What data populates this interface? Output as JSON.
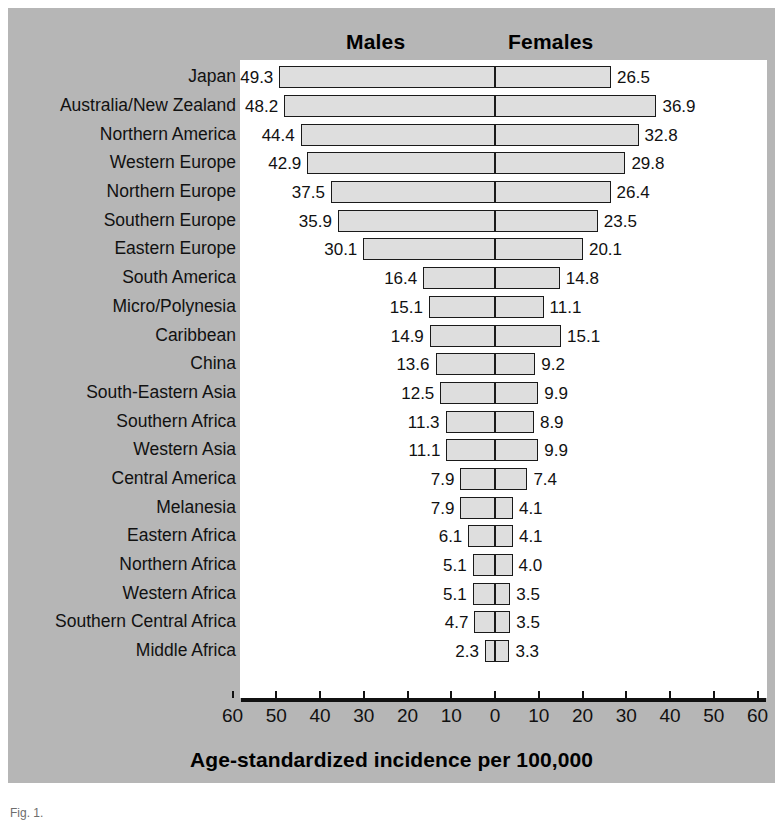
{
  "figure": {
    "caption": "Fig. 1."
  },
  "headers": {
    "males": "Males",
    "females": "Females"
  },
  "axis": {
    "title": "Age-standardized incidence per 100,000",
    "tick_labels": [
      "60",
      "50",
      "40",
      "30",
      "20",
      "10",
      "0",
      "10",
      "20",
      "30",
      "40",
      "50",
      "60"
    ]
  },
  "colors": {
    "panel_background": "#b6b6b6",
    "plot_background": "#ffffff",
    "bar_fill": "#dedede",
    "bar_stroke": "#1a1a1a",
    "text": "#111111"
  },
  "chart_data": {
    "type": "bar",
    "subtype": "diverging-population-pyramid",
    "title": "",
    "xlabel": "Age-standardized incidence per 100,000",
    "ylabel": "",
    "xlim": [
      -60,
      60
    ],
    "xticks": [
      -60,
      -50,
      -40,
      -30,
      -20,
      -10,
      0,
      10,
      20,
      30,
      40,
      50,
      60
    ],
    "xtick_labels": [
      "60",
      "50",
      "40",
      "30",
      "20",
      "10",
      "0",
      "10",
      "20",
      "30",
      "40",
      "50",
      "60"
    ],
    "grid": false,
    "legend": [
      "Males",
      "Females"
    ],
    "legend_position": "top",
    "categories": [
      "Japan",
      "Australia/New Zealand",
      "Northern America",
      "Western Europe",
      "Northern Europe",
      "Southern Europe",
      "Eastern Europe",
      "South America",
      "Micro/Polynesia",
      "Caribbean",
      "China",
      "South-Eastern Asia",
      "Southern Africa",
      "Western Asia",
      "Central America",
      "Melanesia",
      "Eastern Africa",
      "Northern Africa",
      "Western Africa",
      "Southern Central Africa",
      "Middle Africa"
    ],
    "series": [
      {
        "name": "Males",
        "direction": "left",
        "values": [
          49.3,
          48.2,
          44.4,
          42.9,
          37.5,
          35.9,
          30.1,
          16.4,
          15.1,
          14.9,
          13.6,
          12.5,
          11.3,
          11.1,
          7.9,
          7.9,
          6.1,
          5.1,
          5.1,
          4.7,
          2.3
        ]
      },
      {
        "name": "Females",
        "direction": "right",
        "values": [
          26.5,
          36.9,
          32.8,
          29.8,
          26.4,
          23.5,
          20.1,
          14.8,
          11.1,
          15.1,
          9.2,
          9.9,
          8.9,
          9.9,
          7.4,
          4.1,
          4.1,
          4.0,
          3.5,
          3.5,
          3.3
        ]
      }
    ],
    "value_labels": {
      "males": [
        "49.3",
        "48.2",
        "44.4",
        "42.9",
        "37.5",
        "35.9",
        "30.1",
        "16.4",
        "15.1",
        "14.9",
        "13.6",
        "12.5",
        "11.3",
        "11.1",
        "7.9",
        "7.9",
        "6.1",
        "5.1",
        "5.1",
        "4.7",
        "2.3"
      ],
      "females": [
        "26.5",
        "36.9",
        "32.8",
        "29.8",
        "26.4",
        "23.5",
        "20.1",
        "14.8",
        "11.1",
        "15.1",
        "9.2",
        "9.9",
        "8.9",
        "9.9",
        "7.4",
        "4.1",
        "4.1",
        "4.0",
        "3.5",
        "3.5",
        "3.3"
      ]
    }
  }
}
